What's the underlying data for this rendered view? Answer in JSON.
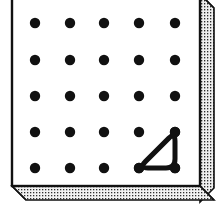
{
  "figure": {
    "name": "geoboard-with-rubber-band-triangle",
    "caption": "Geoboard showing a right triangle formed by a rubber band",
    "canvas": {
      "width": 223,
      "height": 218
    }
  },
  "board": {
    "label": "geoboard",
    "face_color": "#ffffff",
    "outline_color": "#1a1a1a",
    "edge_color": "#d8d8d8",
    "stipple_dot_color": "#303030",
    "face": {
      "x": 12,
      "y": -6,
      "width": 188,
      "height": 192
    },
    "bevel_size": 14,
    "edge_depth": 16
  },
  "pegs": {
    "label": "peg-grid",
    "rows": 5,
    "columns": 5,
    "radius": 5.2,
    "color": "#111111",
    "origin_x": 35,
    "origin_y": 23,
    "spacing_x": 35,
    "spacing_y": 36,
    "points": [
      {
        "row": 0,
        "col": 0,
        "x": 35,
        "y": 23
      },
      {
        "row": 0,
        "col": 1,
        "x": 70,
        "y": 23
      },
      {
        "row": 0,
        "col": 2,
        "x": 104,
        "y": 23
      },
      {
        "row": 0,
        "col": 3,
        "x": 139,
        "y": 23
      },
      {
        "row": 0,
        "col": 4,
        "x": 175,
        "y": 23
      },
      {
        "row": 1,
        "col": 0,
        "x": 35,
        "y": 60
      },
      {
        "row": 1,
        "col": 1,
        "x": 70,
        "y": 60
      },
      {
        "row": 1,
        "col": 2,
        "x": 104,
        "y": 60
      },
      {
        "row": 1,
        "col": 3,
        "x": 139,
        "y": 60
      },
      {
        "row": 1,
        "col": 4,
        "x": 175,
        "y": 60
      },
      {
        "row": 2,
        "col": 0,
        "x": 35,
        "y": 96
      },
      {
        "row": 2,
        "col": 1,
        "x": 70,
        "y": 96
      },
      {
        "row": 2,
        "col": 2,
        "x": 104,
        "y": 96
      },
      {
        "row": 2,
        "col": 3,
        "x": 139,
        "y": 96
      },
      {
        "row": 2,
        "col": 4,
        "x": 175,
        "y": 96
      },
      {
        "row": 3,
        "col": 0,
        "x": 35,
        "y": 132
      },
      {
        "row": 3,
        "col": 1,
        "x": 70,
        "y": 132
      },
      {
        "row": 3,
        "col": 2,
        "x": 104,
        "y": 132
      },
      {
        "row": 3,
        "col": 3,
        "x": 139,
        "y": 132
      },
      {
        "row": 3,
        "col": 4,
        "x": 175,
        "y": 132
      },
      {
        "row": 4,
        "col": 0,
        "x": 35,
        "y": 168
      },
      {
        "row": 4,
        "col": 1,
        "x": 70,
        "y": 168
      },
      {
        "row": 4,
        "col": 2,
        "x": 104,
        "y": 168
      },
      {
        "row": 4,
        "col": 3,
        "x": 139,
        "y": 168
      },
      {
        "row": 4,
        "col": 4,
        "x": 175,
        "y": 168
      }
    ]
  },
  "rubber_band": {
    "label": "rubber-band-triangle",
    "shape": "right-triangle",
    "stroke_color": "#111111",
    "stroke_width": 5,
    "corner_radius": 9,
    "fill": "none",
    "vertices": [
      {
        "name": "top-right",
        "row": 3,
        "col": 4,
        "x": 175,
        "y": 132
      },
      {
        "name": "bottom-right",
        "row": 4,
        "col": 4,
        "x": 175,
        "y": 168
      },
      {
        "name": "bottom-left",
        "row": 4,
        "col": 3,
        "x": 139,
        "y": 168
      }
    ]
  }
}
